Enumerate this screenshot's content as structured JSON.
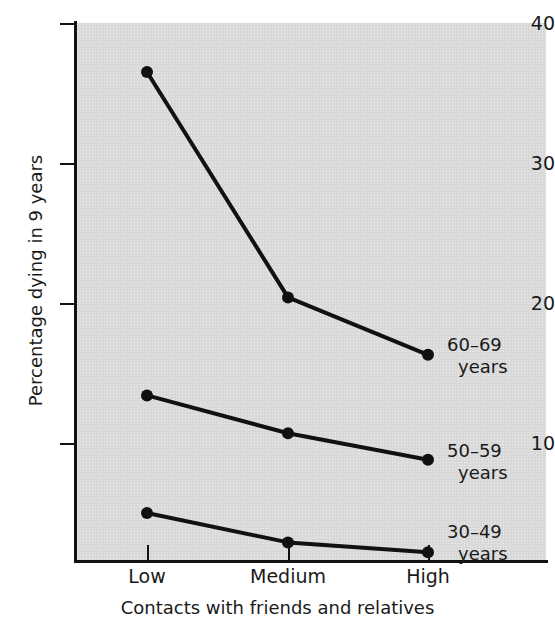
{
  "chart_data": {
    "type": "line",
    "title": "",
    "xlabel": "Contacts with friends and relatives",
    "ylabel": "Percentage dying in 9 years",
    "categories": [
      "Low",
      "Medium",
      "High"
    ],
    "ylim": [
      0,
      40
    ],
    "yticks": [
      10,
      20,
      30,
      40
    ],
    "ytick_labels": [
      "10",
      "20",
      "30",
      "40"
    ],
    "grid": false,
    "legend_position": "right-inline",
    "marker": "filled-circle",
    "line_color": "#111111",
    "plot_background": "#d9d9d9",
    "series": [
      {
        "name": "60–69 years",
        "label_line1": "60–69",
        "label_line2": "years",
        "values": [
          36.5,
          20.4,
          16.3
        ]
      },
      {
        "name": "50–59 years",
        "label_line1": "50–59",
        "label_line2": "years",
        "values": [
          13.4,
          10.7,
          8.8
        ]
      },
      {
        "name": "30–49 years",
        "label_line1": "30–49",
        "label_line2": "years",
        "values": [
          5.0,
          2.9,
          2.2
        ]
      }
    ]
  },
  "axes": {
    "y_title": "Percentage dying in 9 years",
    "x_title": "Contacts with friends and relatives",
    "y_tick_labels": [
      "40",
      "30",
      "20",
      "10"
    ],
    "x_tick_labels": [
      "Low",
      "Medium",
      "High"
    ]
  }
}
